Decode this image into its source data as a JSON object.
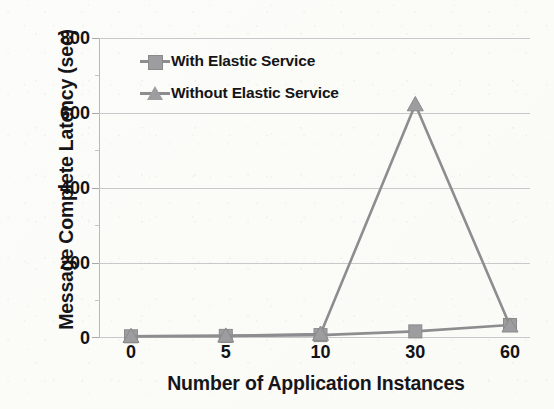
{
  "chart_data": {
    "type": "line",
    "title": "",
    "xlabel": "Number of Application Instances",
    "ylabel": "Message Complete Latency (sec)",
    "categories": [
      "0",
      "5",
      "10",
      "30",
      "60"
    ],
    "yticks": [
      "0",
      "200",
      "400",
      "600",
      "800"
    ],
    "ylim": [
      0,
      800
    ],
    "grid": true,
    "legend_position": "top-left",
    "series": [
      {
        "name": "With Elastic Service",
        "marker": "square",
        "color": "#9d9da0",
        "values": [
          2,
          3,
          5,
          15,
          32
        ]
      },
      {
        "name": "Without Elastic Service",
        "marker": "triangle",
        "color": "#9d9da0",
        "values": [
          2,
          3,
          8,
          622,
          30
        ]
      }
    ]
  },
  "legend": {
    "items": [
      {
        "label": "With Elastic Service",
        "marker": "square-marker-icon"
      },
      {
        "label": "Without Elastic Service",
        "marker": "triangle-marker-icon"
      }
    ]
  },
  "colors": {
    "series": "#9d9da0",
    "line": "#8d8d90",
    "grid": "#c9c9cc",
    "text": "#16161a",
    "background": "#fdfdfb"
  }
}
